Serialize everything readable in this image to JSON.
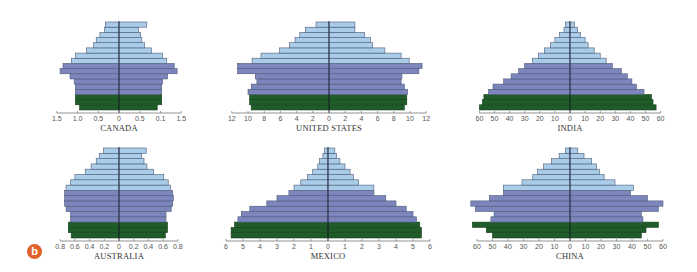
{
  "figure": {
    "panel_label": "b",
    "colors": {
      "post_reproductive": "#a9cde9",
      "reproductive": "#7c86bd",
      "pre_reproductive": "#1f5c2a",
      "bar_stroke": "#4d5a78",
      "axis": "#666666",
      "center_line": "#1a1a2e",
      "badge": "#e0622a"
    }
  },
  "chart_data": [
    {
      "type": "bar",
      "subtype": "population_pyramid",
      "title": "CANADA",
      "xlabel": "",
      "axis_ticks": [
        "1.5",
        "1.0",
        "0.5",
        "0",
        "0.5",
        "0.1",
        "1.5"
      ],
      "xlim": [
        -1.5,
        1.5
      ],
      "age_groups_bottom_to_top": 17,
      "color_groups": {
        "pre_reproductive": 3,
        "reproductive": 6,
        "post_reproductive": 8
      },
      "left_values": [
        0.95,
        1.05,
        1.05,
        1.05,
        1.05,
        1.08,
        1.18,
        1.42,
        1.35,
        1.15,
        1.05,
        0.78,
        0.62,
        0.55,
        0.46,
        0.35,
        0.33
      ],
      "right_values": [
        0.92,
        1.03,
        1.03,
        1.03,
        1.03,
        1.05,
        1.17,
        1.4,
        1.33,
        1.15,
        1.05,
        0.78,
        0.62,
        0.55,
        0.52,
        0.47,
        0.67
      ]
    },
    {
      "type": "bar",
      "subtype": "population_pyramid",
      "title": "UNITED STATES",
      "xlabel": "",
      "axis_ticks": [
        "12",
        "10",
        "8",
        "6",
        "4",
        "2",
        "0",
        "2",
        "4",
        "6",
        "8",
        "10",
        "12"
      ],
      "xlim": [
        -12,
        12
      ],
      "age_groups_bottom_to_top": 17,
      "color_groups": {
        "pre_reproductive": 3,
        "reproductive": 6,
        "post_reproductive": 8
      },
      "left_values": [
        9.6,
        9.8,
        9.8,
        10.0,
        9.6,
        8.9,
        9.1,
        11.3,
        11.3,
        9.5,
        8.4,
        6.1,
        4.9,
        4.2,
        3.6,
        2.9,
        1.6
      ],
      "right_values": [
        9.3,
        9.6,
        9.6,
        9.7,
        9.3,
        8.9,
        9.0,
        11.1,
        11.5,
        9.9,
        8.9,
        6.9,
        5.4,
        5.1,
        4.4,
        3.2,
        3.2
      ]
    },
    {
      "type": "bar",
      "subtype": "population_pyramid",
      "title": "INDIA",
      "xlabel": "",
      "axis_ticks": [
        "60",
        "50",
        "40",
        "30",
        "20",
        "10",
        "0",
        "10",
        "20",
        "30",
        "40",
        "50",
        "60"
      ],
      "xlim": [
        -60,
        60
      ],
      "age_groups_bottom_to_top": 17,
      "color_groups": {
        "pre_reproductive": 3,
        "reproductive": 6,
        "post_reproductive": 8
      },
      "left_values": [
        60,
        58,
        57,
        54,
        51,
        44,
        39,
        34,
        30,
        25,
        21,
        17,
        13,
        10,
        7,
        4,
        3
      ],
      "right_values": [
        57,
        55,
        54,
        49,
        44,
        41,
        38,
        34,
        28,
        24,
        20,
        16,
        12,
        10,
        7,
        5,
        3
      ]
    },
    {
      "type": "bar",
      "subtype": "population_pyramid",
      "title": "AUSTRALIA",
      "xlabel": "",
      "axis_ticks": [
        "0.8",
        "0.6",
        "0.4",
        "0.2",
        "0",
        "0.2",
        "0.4",
        "0.6",
        "0.8"
      ],
      "xlim": [
        -0.8,
        0.8
      ],
      "age_groups_bottom_to_top": 17,
      "color_groups": {
        "pre_reproductive": 3,
        "reproductive": 6,
        "post_reproductive": 8
      },
      "left_values": [
        0.65,
        0.69,
        0.69,
        0.66,
        0.66,
        0.72,
        0.74,
        0.74,
        0.74,
        0.72,
        0.66,
        0.6,
        0.46,
        0.38,
        0.31,
        0.27,
        0.21
      ],
      "right_values": [
        0.63,
        0.66,
        0.66,
        0.64,
        0.64,
        0.71,
        0.73,
        0.74,
        0.73,
        0.7,
        0.67,
        0.61,
        0.47,
        0.38,
        0.34,
        0.31,
        0.37
      ]
    },
    {
      "type": "bar",
      "subtype": "population_pyramid",
      "title": "MEXICO",
      "xlabel": "",
      "axis_ticks": [
        "6",
        "5",
        "4",
        "3",
        "2",
        "1",
        "0",
        "1",
        "2",
        "3",
        "4",
        "5",
        "6"
      ],
      "xlim": [
        -6,
        6
      ],
      "age_groups_bottom_to_top": 17,
      "color_groups": {
        "pre_reproductive": 3,
        "reproductive": 6,
        "post_reproductive": 8
      },
      "left_values": [
        5.7,
        5.7,
        5.5,
        5.3,
        5.1,
        4.6,
        3.6,
        3.0,
        2.3,
        2.0,
        1.6,
        1.2,
        0.9,
        0.6,
        0.5,
        0.3,
        0.2
      ],
      "right_values": [
        5.5,
        5.5,
        5.4,
        5.2,
        5.0,
        4.6,
        4.0,
        3.4,
        2.7,
        2.7,
        1.8,
        1.5,
        1.3,
        1.0,
        0.7,
        0.5,
        0.4
      ]
    },
    {
      "type": "bar",
      "subtype": "population_pyramid",
      "title": "CHINA",
      "xlabel": "",
      "axis_ticks": [
        "60",
        "50",
        "40",
        "30",
        "20",
        "10",
        "0",
        "10",
        "20",
        "30",
        "40",
        "50",
        "60"
      ],
      "xlim": [
        -60,
        60
      ],
      "age_groups_bottom_to_top": 17,
      "color_groups": {
        "pre_reproductive": 3,
        "reproductive": 6,
        "post_reproductive": 8
      },
      "left_values": [
        50,
        54,
        63,
        51,
        49,
        61,
        64,
        52,
        43,
        43,
        31,
        24,
        21,
        17,
        12,
        7,
        3
      ],
      "right_values": [
        46,
        49,
        57,
        47,
        46,
        57,
        60,
        50,
        39,
        41,
        29,
        22,
        19,
        17,
        14,
        9,
        5
      ]
    }
  ]
}
